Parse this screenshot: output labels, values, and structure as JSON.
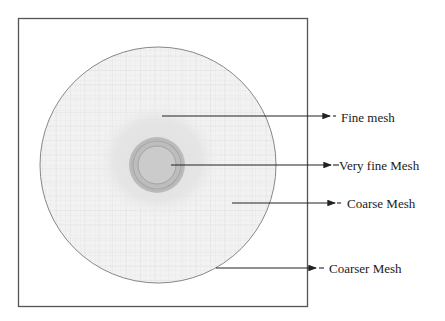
{
  "diagram": {
    "type": "mesh-refinement-schematic",
    "labels": {
      "fine": "Fine mesh",
      "very_fine": "Very fine Mesh",
      "coarse": "Coarse Mesh",
      "coarser": "Coarser Mesh"
    },
    "colors": {
      "frame": "#555555",
      "circle_outline": "#7a7a7a",
      "coarser_fill": "#f1f1f1",
      "coarse_fill": "#ececec",
      "fine_fill": "#e2e2e2",
      "very_fine_ring": "#b5b5b5",
      "very_fine_inner": "#c9c9c9",
      "grid": "#d6d6d6",
      "arrow": "#222222",
      "text": "#1a1a1a"
    }
  }
}
